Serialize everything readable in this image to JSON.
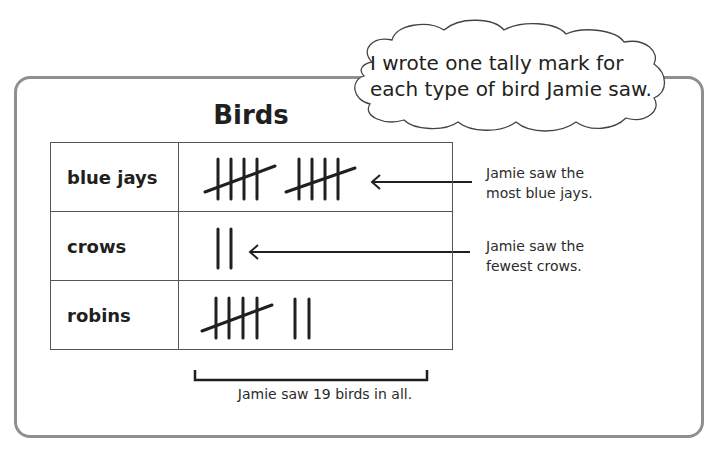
{
  "top_partial_text": "... type of bird Jamie saw ...",
  "speech_bubble": {
    "text_line1": "I wrote one tally mark for",
    "text_line2": "each type of bird Jamie saw."
  },
  "table": {
    "title": "Birds",
    "rows": [
      {
        "label": "blue jays",
        "tally_count": 10
      },
      {
        "label": "crows",
        "tally_count": 2
      },
      {
        "label": "robins",
        "tally_count": 7
      }
    ]
  },
  "annotations": {
    "most": {
      "line1": "Jamie saw the",
      "line2": "most blue jays."
    },
    "fewest": {
      "line1": "Jamie saw the",
      "line2": "fewest crows."
    },
    "total": "Jamie saw 19 birds in all."
  },
  "colors": {
    "frame": "#8f8f8f",
    "ink": "#231f20"
  }
}
